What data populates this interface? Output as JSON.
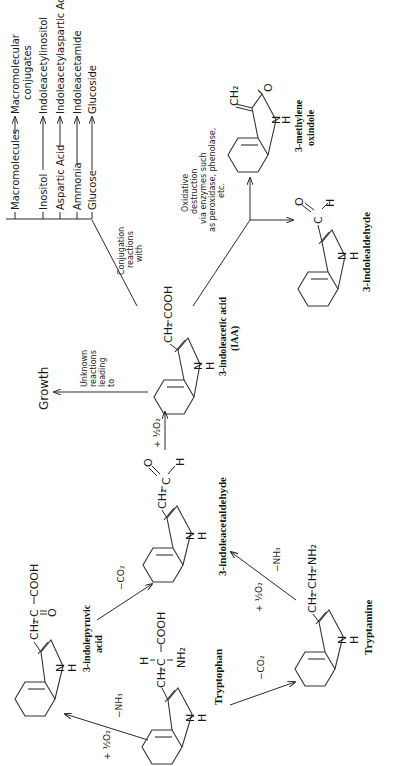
{
  "orientation": "rotated 90 degrees counter-clockwise",
  "compounds": {
    "tryptophan": {
      "label": "Tryptophan",
      "groups": {
        "ch2": "CH₂",
        "c": "C",
        "h": "H",
        "nh2": "NH₂",
        "cooh": "COOH",
        "n": "N",
        "nh": "H"
      }
    },
    "indolepyruvic": {
      "label_line1": "3-indolepyruvic",
      "label_line2": "acid",
      "groups": {
        "ch2": "CH₂",
        "c": "C",
        "o": "O",
        "cooh": "COOH",
        "n": "N",
        "nh": "H"
      }
    },
    "indoleacetaldehyde": {
      "label": "3-indoleacetaldehyde",
      "groups": {
        "ch2": "CH₂",
        "c": "C",
        "o": "O",
        "h": "H",
        "n": "N",
        "nh": "H"
      }
    },
    "tryptamine": {
      "label": "Tryptamine",
      "groups": {
        "ch2a": "CH₂",
        "ch2b": "CH₂",
        "nh2": "NH₂",
        "n": "N",
        "nh": "H"
      }
    },
    "iaa": {
      "label_line1": "3-indoleacetic acid",
      "label_line2": "(IAA)",
      "groups": {
        "ch2": "CH₂",
        "cooh": "COOH",
        "n": "N",
        "nh": "H"
      }
    },
    "indolealdehyde": {
      "label": "3-indolealdehyde",
      "groups": {
        "c": "C",
        "o": "O",
        "h": "H",
        "n": "N",
        "nh": "H"
      }
    },
    "methylene_oxindole": {
      "label_line1": "3-methylene",
      "label_line2": "oxindole",
      "groups": {
        "ch2": "CH₂",
        "o": "O",
        "n": "N",
        "nh": "H"
      }
    }
  },
  "reactions": {
    "trp_to_pyruvic": {
      "reagent1": "+ ½O₂",
      "reagent2": "−NH₃"
    },
    "pyruvic_to_aldehyde": {
      "reagent": "−CO₂"
    },
    "trp_to_tryptamine": {
      "reagent": "−CO₂"
    },
    "tryptamine_to_aldehyde": {
      "reagent1": "+ ½O₂",
      "reagent2": "−NH₃"
    },
    "aldehyde_to_iaa": {
      "reagent": "+ ½O₂"
    },
    "iaa_to_growth": {
      "note_lines": [
        "Unknown",
        "reactions",
        "leading",
        "to"
      ],
      "product": "Growth"
    },
    "conjugation": {
      "note_lines": [
        "Conjugation",
        "reactions",
        "with"
      ],
      "branches": [
        {
          "reactant": "Macromolecules",
          "product_line1": "Macromolecular",
          "product_line2": "conjugates"
        },
        {
          "reactant": "Inositol",
          "product": "Indoleacetylinositol"
        },
        {
          "reactant": "Aspartic  Acid",
          "product": "Indoleacetylaspartic  Acid"
        },
        {
          "reactant": "Ammonia",
          "product": "Indoleacetamide"
        },
        {
          "reactant": "Glucose",
          "product": "Glucoside"
        }
      ]
    },
    "oxidative": {
      "note_lines": [
        "Oxidative",
        "destruction",
        "via enzymes such",
        "as peroxidase, phenolase,",
        "etc."
      ]
    }
  }
}
